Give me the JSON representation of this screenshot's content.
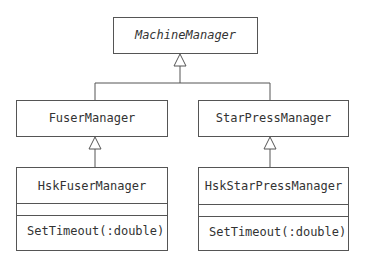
{
  "classes": {
    "machine_manager": {
      "name": "MachineManager",
      "abstract": true
    },
    "fuser_manager": {
      "name": "FuserManager"
    },
    "star_press_manager": {
      "name": "StarPressManager"
    },
    "hsk_fuser_manager": {
      "name": "HskFuserManager",
      "operations": [
        "SetTimeout(:double)"
      ]
    },
    "hsk_star_press_manager": {
      "name": "HskStarPressManager",
      "operations": [
        "SetTimeout(:double)"
      ]
    }
  },
  "relationships": [
    {
      "type": "generalization",
      "from": "FuserManager",
      "to": "MachineManager"
    },
    {
      "type": "generalization",
      "from": "StarPressManager",
      "to": "MachineManager"
    },
    {
      "type": "generalization",
      "from": "HskFuserManager",
      "to": "FuserManager"
    },
    {
      "type": "generalization",
      "from": "HskStarPressManager",
      "to": "StarPressManager"
    }
  ]
}
